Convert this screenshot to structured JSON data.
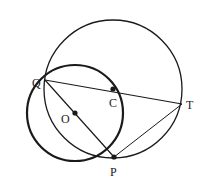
{
  "diagram": {
    "type": "geometry",
    "points": {
      "Q": {
        "label": "Q",
        "x": 45,
        "y": 80
      },
      "C": {
        "label": "C",
        "x": 113,
        "y": 89
      },
      "T": {
        "label": "T",
        "x": 182,
        "y": 104
      },
      "O": {
        "label": "O",
        "x": 75,
        "y": 113
      },
      "P": {
        "label": "P",
        "x": 114,
        "y": 157
      }
    },
    "circles": [
      {
        "name": "circle-O",
        "center": "O",
        "cx": 75,
        "cy": 113,
        "r": 48,
        "stroke_width": 2.2
      },
      {
        "name": "circle-C",
        "center": "C",
        "cx": 113,
        "cy": 89,
        "r": 69,
        "stroke_width": 1.3
      }
    ],
    "segments": [
      {
        "name": "QT",
        "from": "Q",
        "to": "T"
      },
      {
        "name": "QP",
        "from": "Q",
        "to": "P"
      },
      {
        "name": "PT",
        "from": "P",
        "to": "T"
      }
    ],
    "colors": {
      "stroke": "#1a1a1a",
      "background": "#ffffff"
    }
  }
}
